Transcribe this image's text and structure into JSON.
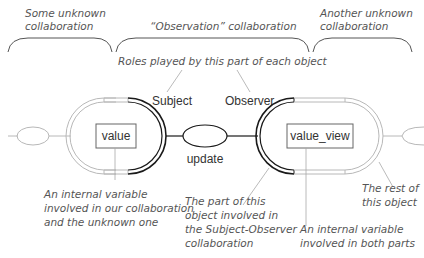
{
  "colors": {
    "background": "#ffffff",
    "role_stroke": "#1a1a1a",
    "object_stroke": "#b8b8b8",
    "leader_line": "#a8a8a8",
    "annotation_text": "#555555",
    "label_text": "#333333"
  },
  "brackets": [
    {
      "label_line1": "Some unknown",
      "label_line2": "collaboration"
    },
    {
      "label_line1": "“Observation” collaboration"
    },
    {
      "label_line1": "Another unknown",
      "label_line2": "collaboration"
    }
  ],
  "roles_caption": "Roles played by this part of each object",
  "roles": {
    "subject": "Subject",
    "observer": "Observer"
  },
  "objects": {
    "left_variable": "value",
    "right_variable": "value_view"
  },
  "connector": {
    "message": "update"
  },
  "annotations": {
    "left_variable": [
      "An internal variable",
      "involved in our collaboration",
      "and the unknown one"
    ],
    "role_part": [
      "The part of this",
      "object involved in",
      "the Subject-Observer",
      "collaboration"
    ],
    "right_variable": [
      "An internal variable",
      "involved in both parts"
    ],
    "rest_of_object": [
      "The rest of",
      "this object"
    ]
  }
}
